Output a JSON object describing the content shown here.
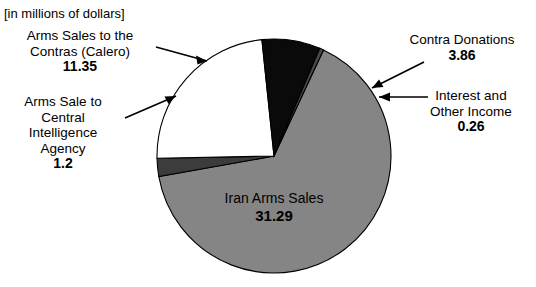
{
  "figure": {
    "units_caption": "[in millions of dollars]",
    "center": {
      "x": 274,
      "y": 156
    },
    "radius": 117,
    "start_angle_deg": -65
  },
  "chart_data": {
    "type": "pie",
    "title": "",
    "subtitle": "",
    "units_note": "[in millions of dollars]",
    "value_unit": "millions of dollars",
    "total": 47.96,
    "legend_position": "callout-labels",
    "grid": false,
    "labels": [
      "Arms Sales to the Contras (Calero)",
      "Contra Donations",
      "Interest and Other Income",
      "Iran Arms Sales",
      "Arms Sale to Central Intelligence Agency"
    ],
    "values": [
      11.35,
      3.86,
      0.26,
      31.29,
      1.2
    ],
    "colors": [
      "#ffffff",
      "#0a0a0a",
      "#4a4a4a",
      "#858585",
      "#3c3c3c"
    ],
    "slices": [
      {
        "label": "Arms Sales to the Contras (Calero)",
        "value": 11.35,
        "value_text": "11.35",
        "percent": 23.7,
        "color": "#ffffff",
        "label_position": "outside-left-top"
      },
      {
        "label": "Contra Donations",
        "value": 3.86,
        "value_text": "3.86",
        "percent": 8.0,
        "color": "#0a0a0a",
        "label_position": "outside-right-top"
      },
      {
        "label": "Interest and Other Income",
        "value": 0.26,
        "value_text": "0.26",
        "percent": 0.5,
        "color": "#4a4a4a",
        "label_position": "outside-right"
      },
      {
        "label": "Iran Arms Sales",
        "value": 31.29,
        "value_text": "31.29",
        "percent": 65.2,
        "color": "#858585",
        "label_position": "inside"
      },
      {
        "label": "Arms Sale to Central Intelligence Agency",
        "value": 1.2,
        "value_text": "1.2",
        "percent": 2.5,
        "color": "#3c3c3c",
        "label_position": "outside-left"
      }
    ]
  },
  "callouts": {
    "contras": {
      "line1": "Arms Sales to the",
      "line2": "Contras (Calero)",
      "value": "11.35"
    },
    "cia": {
      "line1": "Arms Sale to",
      "line2": "Central",
      "line3": "Intelligence",
      "line4": "Agency",
      "value": "1.2"
    },
    "donations": {
      "line1": "Contra Donations",
      "value": "3.86"
    },
    "interest": {
      "line1": "Interest and",
      "line2": "Other Income",
      "value": "0.26"
    },
    "iran": {
      "line1": "Iran Arms Sales",
      "value": "31.29"
    }
  },
  "icons": {
    "arrow_contras": "arrow-right-icon",
    "arrow_cia": "arrow-right-icon",
    "arrow_donations": "arrow-down-left-icon",
    "arrow_interest": "arrow-left-icon"
  }
}
